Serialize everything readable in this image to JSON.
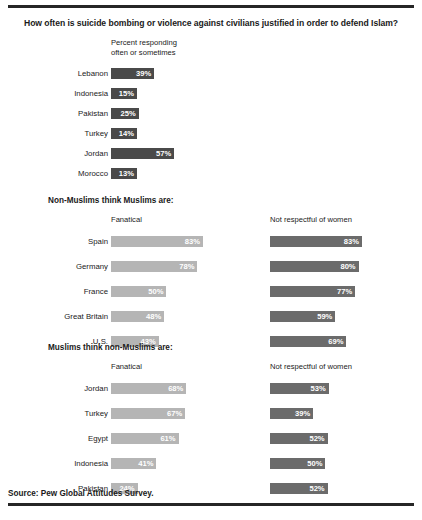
{
  "title": "How often is suicide bombing or violence against civilians justified in order to defend Islam?",
  "source": "Source: Pew Global Attitudes Survey.",
  "colors": {
    "bar_dark": "#4a4a4a",
    "bar_medium": "#6b6b6b",
    "bar_light": "#b5b5b5",
    "rule": "#262626",
    "text": "#1a1a1a",
    "value_text": "#ffffff"
  },
  "sections": [
    {
      "heading": "",
      "columns": [
        {
          "header": "Percent responding\noften or sometimes"
        }
      ]
    },
    {
      "heading": "Non-Muslims think Muslims are:",
      "columns": [
        {
          "header": "Fanatical"
        },
        {
          "header": "Not respectful of women"
        }
      ]
    },
    {
      "heading": "Muslims think non-Muslims are:",
      "columns": [
        {
          "header": "Fanatical"
        },
        {
          "header": "Not respectful of women"
        }
      ]
    }
  ],
  "chart_data": [
    {
      "type": "bar",
      "title": "How often is suicide bombing or violence against civilians justified in order to defend Islam?",
      "subtitle": "Percent responding often or sometimes",
      "orientation": "horizontal",
      "xlabel": "Percent",
      "ylabel": "",
      "xlim": [
        0,
        100
      ],
      "grid": false,
      "legend": "none",
      "categories": [
        "Lebanon",
        "Indonesia",
        "Pakistan",
        "Turkey",
        "Jordan",
        "Morocco"
      ],
      "values": [
        39,
        15,
        25,
        14,
        57,
        13
      ],
      "labels": [
        "39%",
        "15%",
        "25%",
        "14%",
        "57%",
        "13%"
      ],
      "bar_color": "#4a4a4a"
    },
    {
      "type": "bar",
      "title": "Non-Muslims think Muslims are:",
      "orientation": "horizontal",
      "xlabel": "Percent",
      "ylabel": "",
      "xlim": [
        0,
        100
      ],
      "grid": false,
      "legend": "column headers",
      "categories": [
        "Spain",
        "Germany",
        "France",
        "Great Britain",
        "U.S."
      ],
      "series": [
        {
          "name": "Fanatical",
          "values": [
            83,
            78,
            50,
            48,
            43
          ],
          "labels": [
            "83%",
            "78%",
            "50%",
            "48%",
            "43%"
          ],
          "color": "#b5b5b5"
        },
        {
          "name": "Not respectful of women",
          "values": [
            83,
            80,
            77,
            59,
            69
          ],
          "labels": [
            "83%",
            "80%",
            "77%",
            "59%",
            "69%"
          ],
          "color": "#6b6b6b"
        }
      ]
    },
    {
      "type": "bar",
      "title": "Muslims think non-Muslims are:",
      "orientation": "horizontal",
      "xlabel": "Percent",
      "ylabel": "",
      "xlim": [
        0,
        100
      ],
      "grid": false,
      "legend": "column headers",
      "categories": [
        "Jordan",
        "Turkey",
        "Egypt",
        "Indonesia",
        "Pakistan"
      ],
      "series": [
        {
          "name": "Fanatical",
          "values": [
            68,
            67,
            61,
            41,
            24
          ],
          "labels": [
            "68%",
            "67%",
            "61%",
            "41%",
            "24%"
          ],
          "color": "#b5b5b5"
        },
        {
          "name": "Not respectful of women",
          "values": [
            53,
            39,
            52,
            50,
            52
          ],
          "labels": [
            "53%",
            "39%",
            "52%",
            "50%",
            "52%"
          ],
          "color": "#6b6b6b"
        }
      ]
    }
  ]
}
